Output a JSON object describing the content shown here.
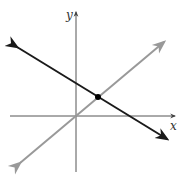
{
  "diagram": {
    "type": "coordinate-plane-two-lines",
    "axes": {
      "x_label": "x",
      "y_label": "y",
      "color": "#555555"
    },
    "lines": [
      {
        "name": "decreasing-line",
        "color": "#1a1a1a",
        "description": "line with negative slope and positive y-intercept"
      },
      {
        "name": "increasing-line",
        "color": "#999999",
        "description": "line through origin with positive slope"
      }
    ],
    "intersection_point": {
      "color": "#000000"
    }
  }
}
